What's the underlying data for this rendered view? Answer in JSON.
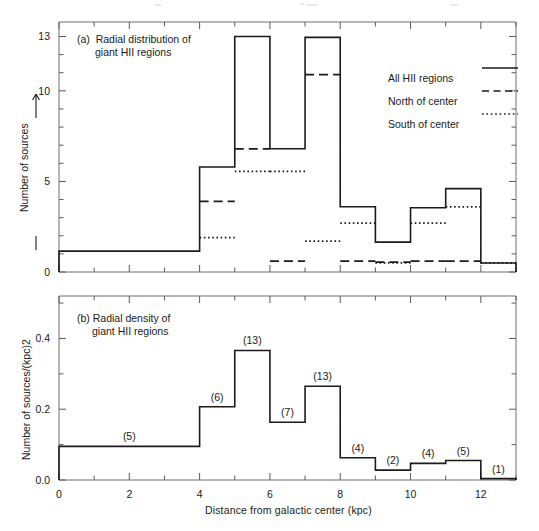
{
  "figure": {
    "xlabel": "Distance from galactic center (kpc)",
    "panel_a": {
      "caption_line1": "(a)  Radial distribution of",
      "caption_line2": "giant HII regions",
      "ylabel": "Number of sources",
      "ytick_labels": [
        "0",
        "5",
        "10",
        "13"
      ]
    },
    "panel_b": {
      "caption_line1": "(b) Radial density of",
      "caption_line2": "giant HII regions",
      "ylabel": "Number of sources/(kpc)2",
      "ytick_labels": [
        "0.0",
        "0.2",
        "0.4"
      ]
    },
    "xtick_labels": [
      "0",
      "2",
      "4",
      "6",
      "8",
      "10",
      "12"
    ],
    "legend": [
      {
        "label": "All HII regions",
        "style": "solid"
      },
      {
        "label": "North of center",
        "style": "dashed"
      },
      {
        "label": "South of center",
        "style": "dotted"
      }
    ]
  },
  "chart_data": [
    {
      "type": "bar",
      "title": "(a)  Radial distribution of giant HII regions",
      "xlabel": "Distance from galactic center (kpc)",
      "ylabel": "Number of sources",
      "xlim": [
        0,
        13
      ],
      "ylim": [
        0,
        13.8
      ],
      "grid": false,
      "bin_edges": [
        0,
        4,
        5,
        6,
        7,
        8,
        9,
        10,
        11,
        12,
        13
      ],
      "bin_labels": [
        "0-4",
        "4-5",
        "5-6",
        "6-7",
        "7-8",
        "8-9",
        "9-10",
        "10-11",
        "11-12",
        "12-13"
      ],
      "series": [
        {
          "name": "All HII regions",
          "style": "solid",
          "values": [
            1.15,
            5.8,
            13.0,
            6.8,
            12.95,
            3.6,
            1.65,
            3.55,
            4.6,
            0.5
          ]
        },
        {
          "name": "North of center",
          "style": "dashed",
          "values": [
            null,
            3.9,
            6.8,
            0.6,
            10.9,
            0.6,
            0.55,
            0.6,
            0.6,
            null
          ]
        },
        {
          "name": "South of center",
          "style": "dotted",
          "values": [
            null,
            1.9,
            5.55,
            5.55,
            1.7,
            2.7,
            0.5,
            2.7,
            3.6,
            0.5
          ]
        }
      ],
      "ytick_values": [
        0,
        5,
        10,
        13
      ]
    },
    {
      "type": "bar",
      "title": "(b) Radial density of giant HII regions",
      "xlabel": "Distance from galactic center (kpc)",
      "ylabel": "Number of sources/(kpc)2",
      "xlim": [
        0,
        13
      ],
      "ylim": [
        0,
        0.52
      ],
      "grid": false,
      "bin_edges": [
        0,
        4,
        5,
        6,
        7,
        8,
        9,
        10,
        11,
        12,
        13
      ],
      "values": [
        0.095,
        0.207,
        0.366,
        0.163,
        0.265,
        0.063,
        0.028,
        0.047,
        0.055,
        0.004
      ],
      "point_labels": [
        "(5)",
        "(6)",
        "(13)",
        "(7)",
        "(13)",
        "(4)",
        "(2)",
        "(4)",
        "(5)",
        "(1)"
      ],
      "ytick_values": [
        0.0,
        0.2,
        0.4
      ]
    }
  ]
}
